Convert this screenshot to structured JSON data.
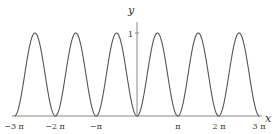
{
  "chart_data": {
    "type": "line",
    "title": "",
    "function": "y = sin^2(x)",
    "xlabel": "x",
    "ylabel": "y",
    "xlim": [
      -9.42,
      9.42
    ],
    "ylim": [
      0,
      1
    ],
    "x_ticks": [
      "-3π",
      "-2π",
      "-π",
      "π",
      "2π",
      "3π"
    ],
    "x_tick_values": [
      -9.4248,
      -6.2832,
      -3.1416,
      3.1416,
      6.2832,
      9.4248
    ],
    "y_ticks": [
      "1"
    ],
    "y_tick_values": [
      1
    ],
    "grid": false,
    "legend": null,
    "series": [
      {
        "name": "sin^2(x)",
        "x": [
          -9.42,
          -7.85,
          -6.28,
          -4.71,
          -3.14,
          -1.57,
          0,
          1.57,
          3.14,
          4.71,
          6.28,
          7.85,
          9.42
        ],
        "values": [
          0,
          1,
          0,
          1,
          0,
          1,
          0,
          1,
          0,
          1,
          0,
          1,
          0
        ]
      }
    ],
    "line_color": "#555555"
  },
  "labels": {
    "x_axis": "x",
    "y_axis": "y",
    "ticks": {
      "neg3pi": "−3 π",
      "neg2pi": "−2 π",
      "negpi": "−π",
      "pi": "π",
      "twopi": "2 π",
      "threepi": "3 π",
      "one": "1"
    }
  }
}
